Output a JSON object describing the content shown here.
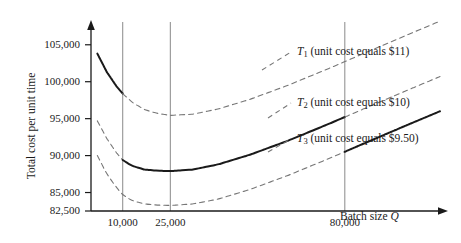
{
  "chart_data": {
    "type": "line",
    "title": "",
    "xlabel": "Batch size Q",
    "ylabel": "Total cost per unit time",
    "xlim": [
      0,
      110000
    ],
    "ylim": [
      82500,
      107000
    ],
    "grid": false,
    "legend_position": "right-inline",
    "x_ticks": [
      {
        "value": 10000,
        "label": "10,000"
      },
      {
        "value": 25000,
        "label": "25,000"
      },
      {
        "value": 80000,
        "label": "80,000"
      }
    ],
    "y_ticks": [
      {
        "value": 82500,
        "label": "82,500"
      },
      {
        "value": 85000,
        "label": "85,000"
      },
      {
        "value": 90000,
        "label": "90,000"
      },
      {
        "value": 95000,
        "label": "95,000"
      },
      {
        "value": 100000,
        "label": "100,000"
      },
      {
        "value": 105000,
        "label": "105,000"
      }
    ],
    "vertical_gridlines": [
      10000,
      25000,
      80000
    ],
    "series": [
      {
        "name": "T1",
        "label_symbol": "T",
        "label_subscript": "1",
        "label_text": "(unit cost equals $11)",
        "unit_cost": 11,
        "solid_range": [
          0,
          10000
        ],
        "x": [
          2000,
          5000,
          8000,
          10000,
          13000,
          17000,
          21000,
          25000,
          32000,
          40000,
          50000,
          62000,
          75000,
          88000,
          100000,
          110000
        ],
        "y": [
          103800,
          101300,
          99400,
          98400,
          97200,
          96200,
          95700,
          95450,
          95600,
          96300,
          97600,
          99500,
          101800,
          104200,
          106400,
          108200
        ]
      },
      {
        "name": "T2",
        "label_symbol": "T",
        "label_subscript": "2",
        "label_text": "(unit cost equals $10)",
        "unit_cost": 10,
        "solid_range": [
          10000,
          80000
        ],
        "x": [
          2000,
          5000,
          8000,
          10000,
          13000,
          17000,
          21000,
          25000,
          32000,
          40000,
          50000,
          62000,
          75000,
          88000,
          100000,
          110000
        ],
        "y": [
          94700,
          92300,
          90400,
          89400,
          88600,
          88100,
          87950,
          87900,
          88100,
          88800,
          90100,
          92000,
          94300,
          96700,
          98900,
          100700
        ]
      },
      {
        "name": "T3",
        "label_symbol": "T",
        "label_subscript": "3",
        "label_text": "(unit cost equals $9.50)",
        "unit_cost": 9.5,
        "solid_range": [
          80000,
          110000
        ],
        "x": [
          2000,
          5000,
          8000,
          10000,
          13000,
          17000,
          21000,
          25000,
          32000,
          40000,
          50000,
          62000,
          75000,
          88000,
          100000,
          110000
        ],
        "y": [
          90000,
          87500,
          85700,
          84700,
          83900,
          83450,
          83300,
          83250,
          83450,
          84100,
          85400,
          87300,
          89600,
          92000,
          94200,
          96000
        ]
      }
    ]
  },
  "axis": {
    "y_label": "Total cost per unit time",
    "x_label_prefix": "Batch size",
    "x_label_symbol": "Q"
  },
  "colors": {
    "axis": "#1a1a1a",
    "gridline": "#8a8a8a",
    "solid_curve": "#1a1a1a",
    "dashed_curve": "#777777",
    "text": "#1a1a1a"
  }
}
